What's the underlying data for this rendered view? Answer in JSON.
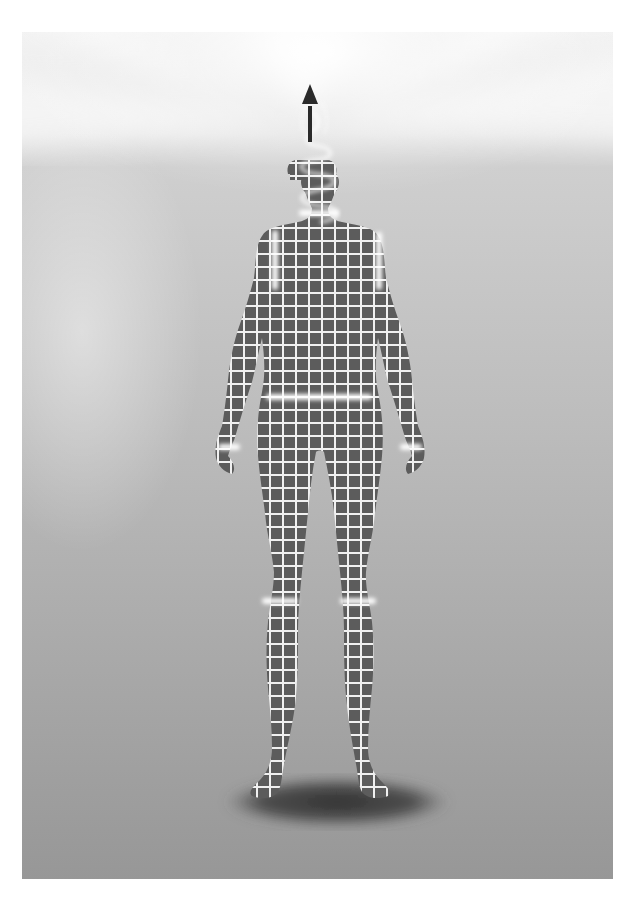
{
  "illustration": {
    "subject": "grid-patterned human figure standing with upward arrow emerging from head",
    "palette": {
      "sky_top": "#f4f4f4",
      "sky_glow": "#ffffff",
      "background_mid": "#c8c8c8",
      "background_bottom": "#9a9a9a",
      "figure_fill": "#5e5e5e",
      "grid_line": "#f2f2f2",
      "highlight_band": "#ffffff",
      "shadow": "#3c3c3c",
      "arrow": "#2a2a2a"
    },
    "grid_spacing_px": 13,
    "highlight_bands": [
      "neck",
      "left-shoulder",
      "right-shoulder",
      "waist",
      "left-wrist",
      "right-wrist",
      "left-knee",
      "right-knee"
    ],
    "elements": [
      "upward-arrow",
      "spiral-smoke",
      "figure",
      "floor-shadow"
    ]
  }
}
